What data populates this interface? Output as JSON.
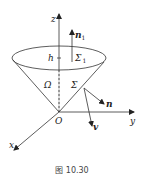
{
  "figure": {
    "caption": "图 10.30",
    "labels": {
      "z_axis": "z",
      "y_axis": "y",
      "x_axis": "x",
      "origin": "O",
      "height": "h",
      "top_surface": "Σ",
      "top_surface_sub": "1",
      "region": "Ω",
      "lateral_surface": "Σ",
      "top_normal": "n",
      "top_normal_sub": "1",
      "lateral_normal": "n",
      "velocity": "v"
    },
    "colors": {
      "line": "#333333",
      "background": "#ffffff"
    }
  }
}
